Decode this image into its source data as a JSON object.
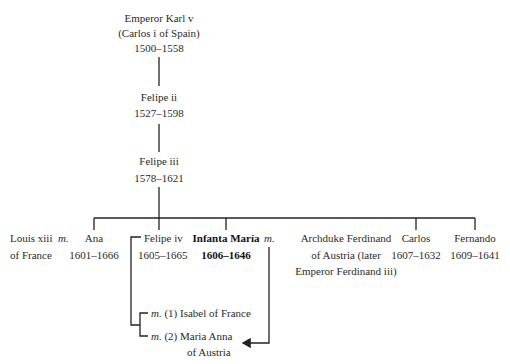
{
  "diagram": {
    "type": "family-tree",
    "root": {
      "name": "Emperor Karl v",
      "alt_name": "(Carlos i of Spain)",
      "dates": "1500–1558"
    },
    "generation_2": {
      "name": "Felipe ii",
      "dates": "1527–1598"
    },
    "generation_3": {
      "name": "Felipe iii",
      "dates": "1578–1621"
    },
    "children": [
      {
        "name": "Ana",
        "dates": "1601–1666",
        "spouse": "Louis xiii of France",
        "spouse_line1": "Louis xiii",
        "spouse_line2": "of France",
        "marriage_marker": "m."
      },
      {
        "name": "Felipe iv",
        "dates": "1605–1665",
        "marriages": [
          {
            "marker": "m.",
            "label": "(1) Isabel of France"
          },
          {
            "marker": "m.",
            "label": "(2) Maria Anna",
            "label_line2": "of Austria"
          }
        ]
      },
      {
        "name": "Infanta María",
        "dates": "1606–1646",
        "highlighted": true,
        "marriage_marker": "m.",
        "spouse_line1": "Archduke Ferdinand",
        "spouse_line2": "of Austria (later",
        "spouse_line3": "Emperor Ferdinand iii)"
      },
      {
        "name": "Carlos",
        "dates": "1607–1632"
      },
      {
        "name": "Fernando",
        "dates": "1609–1641"
      }
    ],
    "annotations": {
      "arrow": "from Infanta María marriage to Maria Anna of Austria"
    }
  }
}
